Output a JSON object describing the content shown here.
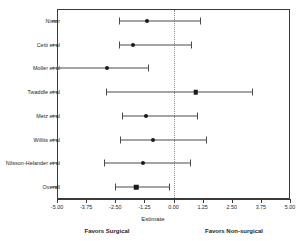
{
  "chart_data": {
    "type": "forest",
    "title": "",
    "xlabel": "Estimate",
    "ylabel": "",
    "xlim": [
      -5.0,
      5.0
    ],
    "xticks": [
      -5.0,
      -3.75,
      -2.5,
      -1.25,
      0.0,
      1.25,
      2.5,
      3.75,
      5.0
    ],
    "xticklabels": [
      "-5.00",
      "-3.75",
      "-2.50",
      "-1.25",
      "0.00",
      "1.25",
      "2.50",
      "3.75",
      "5.00"
    ],
    "grid": false,
    "legend": "none",
    "reference_line": 0.0,
    "reference_line_style": "dotted",
    "categories": [
      "Nistor",
      "Cetti et al",
      "Moller et al",
      "Twaddle et al",
      "Metz et al",
      "Willits et al",
      "Nilsson-Helander et al",
      "Overall"
    ],
    "estimates": [
      -1.15,
      -1.75,
      -2.85,
      0.95,
      -1.2,
      -0.9,
      -1.3,
      -1.6
    ],
    "ci_lower": [
      -2.35,
      -2.35,
      -5.0,
      -2.9,
      -2.2,
      -2.3,
      -3.0,
      -2.5
    ],
    "ci_upper": [
      1.15,
      0.75,
      -1.1,
      3.35,
      1.0,
      1.4,
      0.7,
      -0.2
    ],
    "rows": [
      {
        "label": "Nistor",
        "estimate": -1.15,
        "lower": -2.35,
        "upper": 1.15,
        "marker": "circle"
      },
      {
        "label": "Cetti et al",
        "estimate": -1.75,
        "lower": -2.35,
        "upper": 0.75,
        "marker": "circle"
      },
      {
        "label": "Moller et al",
        "estimate": -2.85,
        "lower": -5.0,
        "upper": -1.1,
        "marker": "circle"
      },
      {
        "label": "Twaddle et al",
        "estimate": 0.95,
        "lower": -2.9,
        "upper": 3.35,
        "marker": "square"
      },
      {
        "label": "Metz et al",
        "estimate": -1.2,
        "lower": -2.2,
        "upper": 1.0,
        "marker": "circle"
      },
      {
        "label": "Willits et al",
        "estimate": -0.9,
        "lower": -2.3,
        "upper": 1.4,
        "marker": "circle"
      },
      {
        "label": "Nilsson-Helander et al",
        "estimate": -1.3,
        "lower": -3.0,
        "upper": 0.7,
        "marker": "circle"
      },
      {
        "label": "Overall",
        "estimate": -1.6,
        "lower": -2.5,
        "upper": -0.2,
        "marker": "square"
      }
    ],
    "annotations": {
      "favors_left": "Favors Surgical",
      "favors_right": "Favors Non-surgical"
    },
    "colors": {
      "marker": "#1a1a1a",
      "ci_line": "#4a4a4a",
      "axis": "#3a3a3a",
      "reference_line": "#8a8a8a",
      "text": "#231f20",
      "background": "#ffffff"
    }
  }
}
